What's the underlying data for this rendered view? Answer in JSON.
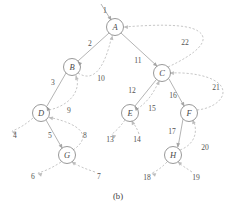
{
  "figure": {
    "caption": "(b)",
    "colors": {
      "node_stroke": "#8d8d8d",
      "tree_edge": "#a6a6a6",
      "back_edge": "#bdbdbd",
      "label_text": "#545454",
      "background": "#ffffff"
    },
    "nodes": [
      {
        "id": "A",
        "label": "A",
        "cx": 115,
        "cy": 27,
        "r": 8.5
      },
      {
        "id": "B",
        "label": "B",
        "cx": 72,
        "cy": 67,
        "r": 8.5
      },
      {
        "id": "C",
        "label": "C",
        "cx": 162,
        "cy": 73,
        "r": 8.5
      },
      {
        "id": "D",
        "label": "D",
        "cx": 41,
        "cy": 113,
        "r": 8.5
      },
      {
        "id": "E",
        "label": "E",
        "cx": 130,
        "cy": 113,
        "r": 8.5
      },
      {
        "id": "F",
        "label": "F",
        "cx": 189,
        "cy": 113,
        "r": 8.5
      },
      {
        "id": "G",
        "label": "G",
        "cx": 67,
        "cy": 155,
        "r": 8.5
      },
      {
        "id": "H",
        "label": "H",
        "cx": 173,
        "cy": 155,
        "r": 8.5
      }
    ],
    "edge_labels": [
      {
        "n": "1",
        "x": 105,
        "y": 10
      },
      {
        "n": "2",
        "x": 90,
        "y": 43
      },
      {
        "n": "3",
        "x": 53,
        "y": 82
      },
      {
        "n": "4",
        "x": 15,
        "y": 135
      },
      {
        "n": "5",
        "x": 50,
        "y": 135
      },
      {
        "n": "6",
        "x": 33,
        "y": 176
      },
      {
        "n": "7",
        "x": 99,
        "y": 176
      },
      {
        "n": "8",
        "x": 85,
        "y": 135
      },
      {
        "n": "9",
        "x": 69,
        "y": 110
      },
      {
        "n": "10",
        "x": 101,
        "y": 78
      },
      {
        "n": "11",
        "x": 138,
        "y": 60
      },
      {
        "n": "12",
        "x": 132,
        "y": 90
      },
      {
        "n": "13",
        "x": 110,
        "y": 139
      },
      {
        "n": "14",
        "x": 137,
        "y": 139
      },
      {
        "n": "15",
        "x": 152,
        "y": 108
      },
      {
        "n": "16",
        "x": 173,
        "y": 95
      },
      {
        "n": "17",
        "x": 172,
        "y": 131
      },
      {
        "n": "18",
        "x": 147,
        "y": 177
      },
      {
        "n": "19",
        "x": 196,
        "y": 177
      },
      {
        "n": "20",
        "x": 205,
        "y": 147
      },
      {
        "n": "21",
        "x": 216,
        "y": 87
      },
      {
        "n": "22",
        "x": 185,
        "y": 42
      }
    ],
    "edges": [
      {
        "name": "edge-enter-A",
        "style": "solid",
        "d": "M 101 4 L 111 20",
        "arrow": {
          "x": 111.5,
          "y": 20.5,
          "angle": 58
        }
      },
      {
        "name": "edge-A-B",
        "style": "solid",
        "d": "M 109 33 L 78 61",
        "arrow": {
          "x": 77.5,
          "y": 61.5,
          "angle": 222
        }
      },
      {
        "name": "edge-B-D",
        "style": "solid",
        "d": "M 66 73 L 47 106",
        "arrow": {
          "x": 46.5,
          "y": 106.5,
          "angle": 240
        }
      },
      {
        "name": "edge-D-out-4",
        "style": "dashed",
        "d": "M 33 118 C 26 124 20 128 12 131",
        "arrow": {
          "x": 11.5,
          "y": 131.5,
          "angle": 200
        }
      },
      {
        "name": "edge-D-G",
        "style": "solid",
        "d": "M 46 120 L 62 148",
        "arrow": {
          "x": 62.5,
          "y": 148.5,
          "angle": 60
        }
      },
      {
        "name": "edge-G-out-6",
        "style": "dashed",
        "d": "M 61 162 C 52 168 45 171 38 173",
        "arrow": {
          "x": 37.5,
          "y": 173.5,
          "angle": 198
        }
      },
      {
        "name": "edge-7-G",
        "style": "dashed",
        "d": "M 95 172 C 86 169 78 166 72 162",
        "arrow": {
          "x": 71.5,
          "y": 161.5,
          "angle": 215
        }
      },
      {
        "name": "edge-G-D-8",
        "style": "dashed",
        "d": "M 73 150 C 88 140 90 126 48 117",
        "arrow": {
          "x": 48.5,
          "y": 117.5,
          "angle": 190
        }
      },
      {
        "name": "edge-D-B-9",
        "style": "dashed",
        "d": "M 49 110 C 68 106 82 92 76 75",
        "arrow": {
          "x": 75.5,
          "y": 75.5,
          "angle": 250
        }
      },
      {
        "name": "edge-B-A-10",
        "style": "dashed",
        "d": "M 78 73 C 92 82 104 72 112 35",
        "arrow": {
          "x": 112.5,
          "y": 35.5,
          "angle": 283
        }
      },
      {
        "name": "edge-A-C-11",
        "style": "solid",
        "d": "M 121 33 L 157 66",
        "arrow": {
          "x": 157.5,
          "y": 66.5,
          "angle": 42
        }
      },
      {
        "name": "edge-C-E-12",
        "style": "solid",
        "d": "M 156 80 L 135 106",
        "arrow": {
          "x": 134.5,
          "y": 106.5,
          "angle": 231
        }
      },
      {
        "name": "edge-E-out-13",
        "style": "dashed",
        "d": "M 125 120 C 120 127 116 131 112 134",
        "arrow": {
          "x": 111.5,
          "y": 134.5,
          "angle": 215
        }
      },
      {
        "name": "edge-14-E",
        "style": "dashed",
        "d": "M 139 134 C 137 128 134 124 132 121",
        "arrow": {
          "x": 131.5,
          "y": 120.5,
          "angle": 242
        }
      },
      {
        "name": "edge-E-C-15",
        "style": "dashed",
        "d": "M 137 109 C 148 102 154 92 159 81",
        "arrow": {
          "x": 159.5,
          "y": 80.5,
          "angle": 295
        }
      },
      {
        "name": "edge-C-F-16",
        "style": "solid",
        "d": "M 169 79 L 184 106",
        "arrow": {
          "x": 184.5,
          "y": 106.5,
          "angle": 60
        }
      },
      {
        "name": "edge-F-H-17",
        "style": "solid",
        "d": "M 183 119 L 178 147",
        "arrow": {
          "x": 177.5,
          "y": 147.5,
          "angle": 100
        }
      },
      {
        "name": "edge-H-out-18",
        "style": "dashed",
        "d": "M 167 162 C 161 168 157 171 152 173",
        "arrow": {
          "x": 151.5,
          "y": 173.5,
          "angle": 200
        }
      },
      {
        "name": "edge-19-H",
        "style": "dashed",
        "d": "M 192 172 C 186 168 181 165 178 162",
        "arrow": {
          "x": 177.5,
          "y": 161.5,
          "angle": 218
        }
      },
      {
        "name": "edge-H-F-20",
        "style": "dashed",
        "d": "M 180 150 C 196 144 198 130 193 120",
        "arrow": {
          "x": 192.5,
          "y": 119.5,
          "angle": 250
        }
      },
      {
        "name": "edge-F-C-21",
        "style": "dashed",
        "d": "M 197 110 C 216 108 228 96 221 86 C 214 76 190 72 170 73",
        "arrow": {
          "x": 169.5,
          "y": 73,
          "angle": 182
        }
      },
      {
        "name": "edge-C-A-22",
        "style": "dashed",
        "d": "M 168 67 C 196 54 212 40 198 31 C 186 23 150 25 124 27",
        "arrow": {
          "x": 123.5,
          "y": 27,
          "angle": 182
        }
      }
    ]
  }
}
